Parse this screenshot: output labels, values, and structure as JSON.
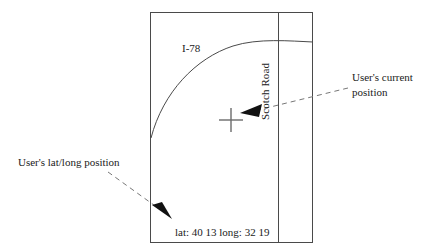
{
  "figure": {
    "name": "gps-map-sketch",
    "background_color": "#ffffff",
    "line_color": "#4a4a4a",
    "text_color": "#1a1a1a"
  },
  "map": {
    "frame_label": "map-viewport",
    "roads": [
      {
        "id": "interstate",
        "label": "I-78",
        "shape": "curve"
      },
      {
        "id": "scotch",
        "label": "Scotch Road",
        "shape": "vertical-line",
        "orientation": "rotated-90"
      }
    ],
    "position_marker": {
      "name": "crosshair-marker",
      "glyph": "+"
    },
    "coordinate_readout": "lat: 40 13 long: 32 19"
  },
  "annotations": [
    {
      "id": "current-position",
      "text": "User's current position",
      "line1": "User's current",
      "line2": "position",
      "leader": "dashed-arrow-left"
    },
    {
      "id": "latlong-position",
      "text": "User's lat/long position",
      "leader": "dashed-arrow-down-right"
    }
  ]
}
